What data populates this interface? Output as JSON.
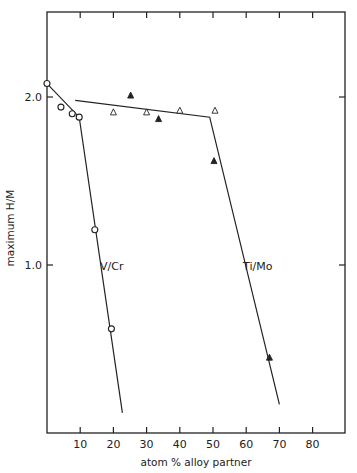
{
  "chart_data": {
    "type": "scatter",
    "title": "",
    "xlabel": "atom % alloy partner",
    "ylabel": "maximum H/M",
    "xlim": [
      0,
      90
    ],
    "ylim": [
      0,
      2.5
    ],
    "x_ticks": [
      10,
      20,
      30,
      40,
      50,
      60,
      70,
      80
    ],
    "x_tick_labels": [
      "10",
      "20",
      "30",
      "40",
      "50",
      "60",
      "70",
      "80"
    ],
    "y_ticks": [
      1.0,
      2.0
    ],
    "y_tick_labels": [
      "1.0",
      "2.0"
    ],
    "grid": false,
    "legend": "none (inline labels)",
    "series": [
      {
        "name": "V/Cr",
        "marker": "open-circle",
        "points": [
          {
            "x": 0,
            "y": 2.08
          },
          {
            "x": 4.2,
            "y": 1.94
          },
          {
            "x": 7.6,
            "y": 1.9
          },
          {
            "x": 9.7,
            "y": 1.88
          },
          {
            "x": 14.4,
            "y": 1.21
          },
          {
            "x": 19.4,
            "y": 0.62
          }
        ],
        "fit_line": [
          {
            "x": 0,
            "y": 2.08
          },
          {
            "x": 9.7,
            "y": 1.88
          },
          {
            "x": 22.7,
            "y": 0.12
          }
        ],
        "label": "V/Cr",
        "label_pos": {
          "x": 16,
          "y": 1.0
        }
      },
      {
        "name": "Ti/Mo (open)",
        "marker": "open-triangle",
        "points": [
          {
            "x": 20,
            "y": 1.91
          },
          {
            "x": 30,
            "y": 1.91
          },
          {
            "x": 40,
            "y": 1.92
          },
          {
            "x": 50.6,
            "y": 1.92
          }
        ]
      },
      {
        "name": "Ti/Mo (filled)",
        "marker": "filled-triangle",
        "points": [
          {
            "x": 25.2,
            "y": 2.01
          },
          {
            "x": 33.6,
            "y": 1.87
          },
          {
            "x": 50.3,
            "y": 1.62
          },
          {
            "x": 67,
            "y": 0.45
          }
        ]
      },
      {
        "name": "Ti/Mo",
        "marker": "none",
        "fit_line": [
          {
            "x": 8.5,
            "y": 1.98
          },
          {
            "x": 49,
            "y": 1.88
          },
          {
            "x": 70,
            "y": 0.17
          }
        ],
        "label": "Ti/Mo",
        "label_pos": {
          "x": 57.5,
          "y": 1.0
        }
      }
    ]
  },
  "labels": {
    "xlabel": "atom % alloy partner",
    "ylabel": "maximum H/M",
    "vcr": "V/Cr",
    "timo": "Ti/Mo"
  },
  "colors": {
    "ink": "#222222",
    "background": "#ffffff"
  }
}
